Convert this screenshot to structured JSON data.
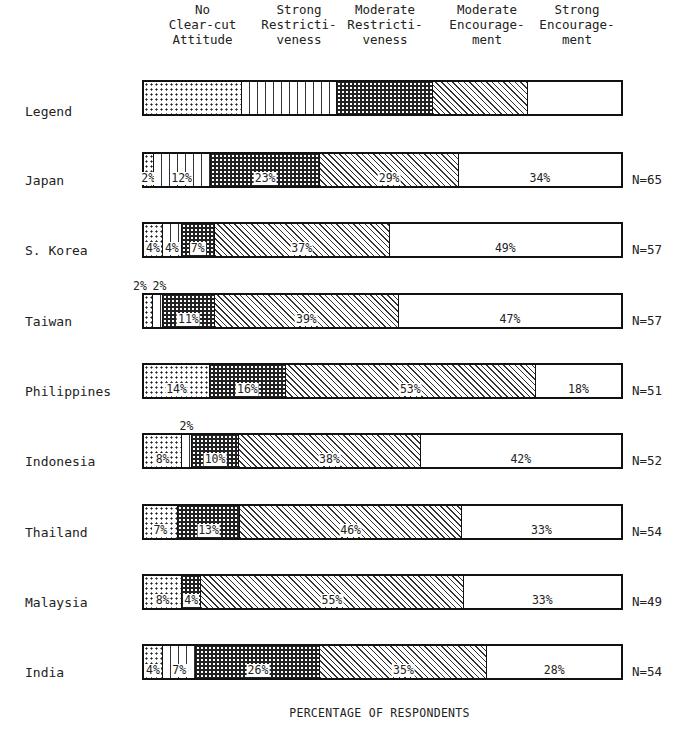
{
  "chart_data": {
    "type": "bar",
    "orientation": "horizontal",
    "stacked": true,
    "title": "",
    "xlabel": "PERCENTAGE OF RESPONDENTS",
    "ylabel": "",
    "xlim": [
      0,
      100
    ],
    "grid": false,
    "legend_position": "top (as a pattern key bar labeled 'Legend')",
    "legend": [
      {
        "key": "no_clear_cut",
        "label": "No Clear-cut Attitude",
        "pattern": "fine dots on white"
      },
      {
        "key": "strong_restrict",
        "label": "Strong Restrictiveness",
        "pattern": "vertical lines"
      },
      {
        "key": "moderate_restrict",
        "label": "Moderate Restrictiveness",
        "pattern": "dense dark dots"
      },
      {
        "key": "moderate_encourage",
        "label": "Moderate Encouragement",
        "pattern": "diagonal hatching"
      },
      {
        "key": "strong_encourage",
        "label": "Strong Encouragement",
        "pattern": "plain white"
      }
    ],
    "categories": [
      "Japan",
      "S. Korea",
      "Taiwan",
      "Philippines",
      "Indonesia",
      "Thailand",
      "Malaysia",
      "India"
    ],
    "series": [
      {
        "name": "No Clear-cut Attitude",
        "values": [
          2,
          4,
          2,
          14,
          8,
          7,
          8,
          4
        ]
      },
      {
        "name": "Strong Restrictiveness",
        "values": [
          12,
          4,
          2,
          0,
          2,
          0,
          0,
          7
        ]
      },
      {
        "name": "Moderate Restrictiveness",
        "values": [
          23,
          7,
          11,
          16,
          10,
          13,
          4,
          26
        ]
      },
      {
        "name": "Moderate Encouragement",
        "values": [
          29,
          37,
          39,
          53,
          38,
          46,
          55,
          35
        ]
      },
      {
        "name": "Strong Encouragement",
        "values": [
          34,
          49,
          47,
          18,
          42,
          33,
          33,
          28
        ]
      }
    ],
    "n_values": [
      "N=65",
      "N=57",
      "N=57",
      "N=51",
      "N=52",
      "N=54",
      "N=49",
      "N=54"
    ]
  },
  "headers": [
    {
      "text": "No\nClear-cut\nAttitude",
      "x": 145,
      "w": 115
    },
    {
      "text": "Strong\nRestricti-\nveness",
      "x": 244,
      "w": 110
    },
    {
      "text": "Moderate\nRestricti-\nveness",
      "x": 330,
      "w": 110
    },
    {
      "text": "Moderate\nEncourage-\nment",
      "x": 432,
      "w": 110
    },
    {
      "text": "Strong\nEncourage-\nment",
      "x": 522,
      "w": 110
    }
  ],
  "legend_label": "Legend",
  "rows": [
    {
      "label": "Japan",
      "n": "N=65",
      "segs": [
        {
          "p": "none",
          "v": 2,
          "t": "2%"
        },
        {
          "p": "sr",
          "v": 12,
          "t": "12%"
        },
        {
          "p": "mr",
          "v": 23,
          "t": "23%"
        },
        {
          "p": "me",
          "v": 29,
          "t": "29%"
        },
        {
          "p": "se",
          "v": 34,
          "t": "34%"
        }
      ]
    },
    {
      "label": "S. Korea",
      "n": "N=57",
      "segs": [
        {
          "p": "none",
          "v": 4,
          "t": "4%"
        },
        {
          "p": "sr",
          "v": 4,
          "t": "4%"
        },
        {
          "p": "mr",
          "v": 7,
          "t": "7%"
        },
        {
          "p": "me",
          "v": 37,
          "t": "37%"
        },
        {
          "p": "se",
          "v": 49,
          "t": "49%"
        }
      ]
    },
    {
      "label": "Taiwan",
      "n": "N=57",
      "segs": [
        {
          "p": "none",
          "v": 2,
          "t": "2%",
          "above": true
        },
        {
          "p": "sr",
          "v": 2,
          "t": "2%",
          "above": true
        },
        {
          "p": "mr",
          "v": 11,
          "t": "11%"
        },
        {
          "p": "me",
          "v": 39,
          "t": "39%"
        },
        {
          "p": "se",
          "v": 47,
          "t": "47%"
        }
      ]
    },
    {
      "label": "Philippines",
      "n": "N=51",
      "segs": [
        {
          "p": "none",
          "v": 14,
          "t": "14%"
        },
        {
          "p": "mr",
          "v": 16,
          "t": "16%"
        },
        {
          "p": "me",
          "v": 53,
          "t": "53%"
        },
        {
          "p": "se",
          "v": 18,
          "t": "18%"
        }
      ]
    },
    {
      "label": "Indonesia",
      "n": "N=52",
      "segs": [
        {
          "p": "none",
          "v": 8,
          "t": "8%"
        },
        {
          "p": "sr",
          "v": 2,
          "t": "2%",
          "above": true
        },
        {
          "p": "mr",
          "v": 10,
          "t": "10%"
        },
        {
          "p": "me",
          "v": 38,
          "t": "38%"
        },
        {
          "p": "se",
          "v": 42,
          "t": "42%"
        }
      ]
    },
    {
      "label": "Thailand",
      "n": "N=54",
      "segs": [
        {
          "p": "none",
          "v": 7,
          "t": "7%"
        },
        {
          "p": "mr",
          "v": 13,
          "t": "13%"
        },
        {
          "p": "me",
          "v": 46,
          "t": "46%"
        },
        {
          "p": "se",
          "v": 33,
          "t": "33%"
        }
      ]
    },
    {
      "label": "Malaysia",
      "n": "N=49",
      "segs": [
        {
          "p": "none",
          "v": 8,
          "t": "8%"
        },
        {
          "p": "mr",
          "v": 4,
          "t": "4%"
        },
        {
          "p": "me",
          "v": 55,
          "t": "55%"
        },
        {
          "p": "se",
          "v": 33,
          "t": "33%"
        }
      ]
    },
    {
      "label": "India",
      "n": "N=54",
      "segs": [
        {
          "p": "none",
          "v": 4,
          "t": "4%"
        },
        {
          "p": "sr",
          "v": 7,
          "t": "7%"
        },
        {
          "p": "mr",
          "v": 26,
          "t": "26%"
        },
        {
          "p": "me",
          "v": 35,
          "t": "35%"
        },
        {
          "p": "se",
          "v": 28,
          "t": "28%"
        }
      ]
    }
  ],
  "xlabel": "PERCENTAGE OF RESPONDENTS"
}
